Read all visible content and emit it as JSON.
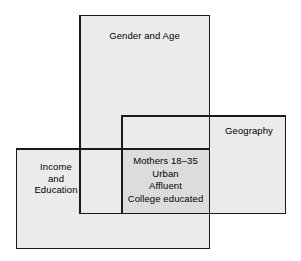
{
  "diagram": {
    "type": "overlapping-sets-venn",
    "background_color": "#ffffff",
    "region_fill_color": "#ebebeb",
    "intersection_fill_color": "#dcdcdc",
    "border_color": "#1a1a1a",
    "text_color": "#000000",
    "regions": [
      {
        "id": "gender-age",
        "label": "Gender and Age",
        "label_position": "top-center"
      },
      {
        "id": "geography",
        "label": "Geography",
        "label_position": "right"
      },
      {
        "id": "income-education",
        "label": "Income\nand\nEducation",
        "label_position": "left"
      }
    ],
    "intersection": {
      "id": "all-three-intersection",
      "label": "Mothers 18–35\nUrban\nAffluent\nCollege educated",
      "lines": [
        "Mothers 18–35",
        "Urban",
        "Affluent",
        "College educated"
      ]
    }
  }
}
